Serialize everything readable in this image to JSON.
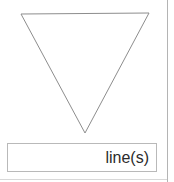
{
  "canvas": {
    "width": 174,
    "height": 182,
    "background_color": "#ffffff"
  },
  "shape": {
    "name": "inverted-triangle",
    "stroke_color": "#8d8d8d",
    "fill": "none",
    "stroke_width": 1,
    "points": "21,14 149,13 85,133",
    "vertices": [
      {
        "x": 21,
        "y": 14
      },
      {
        "x": 149,
        "y": 13
      },
      {
        "x": 85,
        "y": 133
      }
    ]
  },
  "label_box": {
    "text": "line(s)",
    "text_align": "right",
    "border_color": "#b9b9b9",
    "background_color": "#ffffff",
    "text_color": "#2b2b2b"
  },
  "dividers": {
    "right_rule_color": "#b4b4b4",
    "bottom_rule_color": "#d8d8d8"
  }
}
